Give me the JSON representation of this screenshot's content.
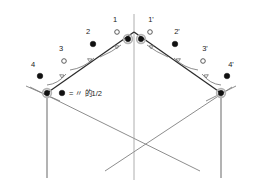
{
  "figure": {
    "legend": {
      "symbol": "●",
      "text": "= 〃 的1/2"
    },
    "labels": {
      "left": [
        {
          "id": "1",
          "text": "1",
          "marker": "open",
          "x": 115,
          "y": 22,
          "node_x": 117,
          "node_y": 32
        },
        {
          "id": "2",
          "text": "2",
          "marker": "filled",
          "x": 88,
          "y": 34,
          "node_x": 93,
          "node_y": 44
        },
        {
          "id": "3",
          "text": "3",
          "marker": "open",
          "x": 61,
          "y": 51,
          "node_x": 64,
          "node_y": 61
        },
        {
          "id": "4",
          "text": "4",
          "marker": "filled",
          "x": 35,
          "y": 66,
          "node_x": 40,
          "node_y": 76
        }
      ],
      "right": [
        {
          "id": "1p",
          "text": "1'",
          "marker": "open",
          "x": 150,
          "y": 22,
          "node_x": 150,
          "node_y": 32
        },
        {
          "id": "2p",
          "text": "2'",
          "marker": "filled",
          "x": 173,
          "y": 34,
          "node_x": 175,
          "node_y": 44
        },
        {
          "id": "3p",
          "text": "3'",
          "marker": "open",
          "x": 202,
          "y": 51,
          "node_x": 203,
          "node_y": 61
        },
        {
          "id": "4p",
          "text": "4'",
          "marker": "filled",
          "x": 228,
          "y": 66,
          "node_x": 227,
          "node_y": 76
        }
      ]
    },
    "ridge_nodes": [
      {
        "id": "ridge-left",
        "x": 128,
        "y": 39
      },
      {
        "id": "ridge-right",
        "x": 141,
        "y": 39
      }
    ],
    "eave_nodes": [
      {
        "id": "eave-left",
        "x": 47,
        "y": 93
      },
      {
        "id": "eave-right",
        "x": 221,
        "y": 93
      }
    ],
    "colors": {
      "rafter": "#2b2b2b",
      "frame": "#808080",
      "arrow": "#6e6e6e",
      "node_filled": "#111111",
      "node_open_stroke": "#4a4a4a",
      "background": "#ffffff",
      "text": "#1a1a1a"
    }
  }
}
